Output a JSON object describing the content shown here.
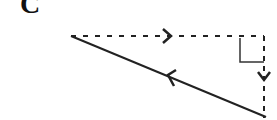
{
  "diagram": {
    "label": "C",
    "type": "vector triangle",
    "elements": [
      {
        "name": "horizontal-component",
        "style": "dashed",
        "direction": "right"
      },
      {
        "name": "vertical-component",
        "style": "dashed",
        "direction": "down"
      },
      {
        "name": "resultant",
        "style": "solid",
        "direction": "up-left"
      },
      {
        "name": "right-angle-marker",
        "position": "top-right corner"
      }
    ],
    "colors": {
      "stroke": "#222222",
      "background": "#ffffff"
    }
  }
}
